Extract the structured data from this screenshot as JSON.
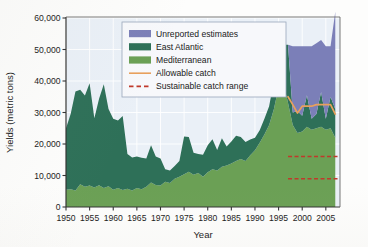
{
  "chart_data": {
    "type": "area",
    "title": "",
    "xlabel": "Year",
    "ylabel": "Yields (metric tons)",
    "xlim": [
      1950,
      2008
    ],
    "ylim": [
      0,
      60000
    ],
    "grid": true,
    "legend_position": "top-center",
    "y_ticks": [
      0,
      10000,
      20000,
      30000,
      40000,
      50000,
      60000
    ],
    "y_tick_labels": [
      "0",
      "10,000",
      "20,000",
      "30,000",
      "40,000",
      "50,000",
      "60,000"
    ],
    "x_ticks": [
      1950,
      1955,
      1960,
      1965,
      1970,
      1975,
      1980,
      1985,
      1990,
      1995,
      2000,
      2005
    ],
    "x_tick_labels": [
      "1950",
      "1955",
      "1960",
      "1965",
      "1970",
      "1975",
      "1980",
      "1985",
      "1990",
      "1995",
      "2000",
      "2005"
    ],
    "x": [
      1950,
      1951,
      1952,
      1953,
      1954,
      1955,
      1956,
      1957,
      1958,
      1959,
      1960,
      1961,
      1962,
      1963,
      1964,
      1965,
      1966,
      1967,
      1968,
      1969,
      1970,
      1971,
      1972,
      1973,
      1974,
      1975,
      1976,
      1977,
      1978,
      1979,
      1980,
      1981,
      1982,
      1983,
      1984,
      1985,
      1986,
      1987,
      1988,
      1989,
      1990,
      1991,
      1992,
      1993,
      1994,
      1995,
      1996,
      1997,
      1998,
      1999,
      2000,
      2001,
      2002,
      2003,
      2004,
      2005,
      2006,
      2007
    ],
    "series": [
      {
        "name": "Mediterranean",
        "color": "#6ba055",
        "stacked": true,
        "values": [
          5500,
          5600,
          5200,
          7200,
          6400,
          6800,
          6200,
          6900,
          6000,
          6600,
          5500,
          6000,
          5400,
          5800,
          5200,
          6000,
          5600,
          6400,
          7800,
          7000,
          6800,
          8000,
          7600,
          9000,
          9600,
          10400,
          11200,
          10200,
          10800,
          9600,
          11000,
          12000,
          11600,
          12800,
          13200,
          13800,
          14600,
          15200,
          14600,
          16400,
          18000,
          20400,
          23000,
          26000,
          31000,
          38000,
          39500,
          33000,
          26000,
          23500,
          24000,
          25500,
          24500,
          25000,
          25500,
          24500,
          25000,
          22000
        ]
      },
      {
        "name": "East Atlantic",
        "color": "#2e7058",
        "stacked": true,
        "values": [
          19500,
          24000,
          31500,
          30000,
          29000,
          32500,
          22000,
          27500,
          33000,
          24500,
          22500,
          21500,
          23500,
          11000,
          10500,
          10000,
          10000,
          9000,
          11800,
          9000,
          8600,
          4000,
          4000,
          4000,
          5000,
          12000,
          11000,
          7000,
          6000,
          7000,
          8600,
          9500,
          6500,
          9000,
          6000,
          7000,
          8000,
          7000,
          6000,
          5000,
          4000,
          4000,
          5000,
          6000,
          9000,
          10000,
          12000,
          18500,
          4000,
          7000,
          5000,
          10000,
          3500,
          4500,
          11000,
          3500,
          10000,
          9000
        ]
      },
      {
        "name": "Unreported estimates",
        "color": "#7b7fb8",
        "stacked": true,
        "values": [
          0,
          0,
          0,
          0,
          0,
          0,
          0,
          0,
          0,
          0,
          0,
          0,
          0,
          0,
          0,
          0,
          0,
          0,
          0,
          0,
          0,
          0,
          0,
          0,
          0,
          0,
          0,
          0,
          0,
          0,
          0,
          0,
          0,
          0,
          0,
          0,
          0,
          0,
          0,
          0,
          0,
          0,
          0,
          0,
          0,
          0,
          0,
          0,
          21000,
          20500,
          22000,
          15500,
          23000,
          22500,
          16500,
          23000,
          16000,
          31000
        ]
      }
    ],
    "lines": [
      {
        "name": "Allowable catch",
        "color": "#e8a05c",
        "style": "solid",
        "x": [
          1997,
          1998,
          1999,
          2000,
          2001,
          2002,
          2003,
          2004,
          2005,
          2006,
          2007
        ],
        "values": [
          35000,
          32500,
          29800,
          32000,
          32000,
          32000,
          32500,
          32500,
          32500,
          32500,
          29500
        ]
      },
      {
        "name": "Sustainable catch range",
        "color": "#c0392b",
        "style": "dashed",
        "x": [
          1997,
          2008
        ],
        "upper": 16000,
        "lower": 9000
      }
    ],
    "legend": [
      {
        "label": "Unreported estimates",
        "color": "#7b7fb8",
        "marker": "swatch"
      },
      {
        "label": "East Atlantic",
        "color": "#2e7058",
        "marker": "swatch"
      },
      {
        "label": "Mediterranean",
        "color": "#6ba055",
        "marker": "swatch"
      },
      {
        "label": "Allowable catch",
        "color": "#e8a05c",
        "marker": "line-solid"
      },
      {
        "label": "Sustainable catch range",
        "color": "#c0392b",
        "marker": "line-dashed"
      }
    ],
    "plot_background": "#eaf0f7",
    "grid_color": "#ffffff"
  }
}
